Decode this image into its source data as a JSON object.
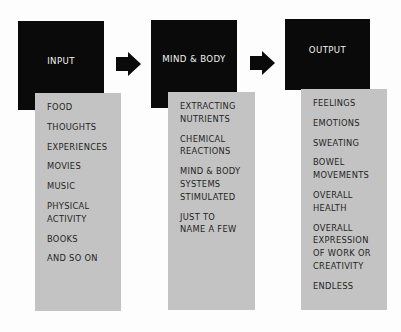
{
  "diagram": {
    "stages": [
      {
        "title": "INPUT",
        "items": [
          "FOOD",
          "THOUGHTS",
          "EXPERIENCES",
          "MOVIES",
          "MUSIC",
          "PHYSICAL\nACTIVITY",
          "BOOKS",
          "AND SO ON"
        ]
      },
      {
        "title": "MIND & BODY",
        "items": [
          "EXTRACTING\nNUTRIENTS",
          "CHEMICAL\nREACTIONS",
          "MIND & BODY\nSYSTEMS\nSTIMULATED",
          "JUST TO\nNAME A FEW"
        ]
      },
      {
        "title": "OUTPUT",
        "items": [
          "FEELINGS",
          "EMOTIONS",
          "SWEATING",
          "BOWEL\nMOVEMENTS",
          "OVERALL\nHEALTH",
          "OVERALL\nEXPRESSION\nOF WORK OR\nCREATIVITY",
          "ENDLESS"
        ]
      }
    ],
    "connectors": [
      {
        "icon": "right-arrow-icon",
        "from": "INPUT",
        "to": "MIND & BODY"
      },
      {
        "icon": "right-arrow-icon",
        "from": "MIND & BODY",
        "to": "OUTPUT"
      }
    ],
    "colors": {
      "header_bg": "#0a0a0a",
      "header_text": "#f2f2f2",
      "list_bg": "#c3c3c3",
      "list_text": "#232323",
      "arrow": "#0a0a0a",
      "background": "#fdfdfd"
    }
  }
}
